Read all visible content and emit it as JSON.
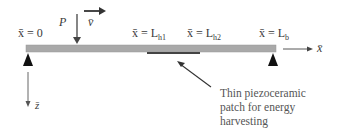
{
  "diagram": {
    "labels": {
      "x0": "x̄ = 0",
      "load": "P",
      "velocity": "v̄",
      "lh1": "x̄ = L",
      "lh1_sub": "h1",
      "lh2": "x̄ = L",
      "lh2_sub": "h2",
      "lb": "x̄ = L",
      "lb_sub": "b",
      "x_axis": "x̄",
      "z_axis": "z̄"
    },
    "annotation": {
      "line1": "Thin piezoceramic",
      "line2": "patch for energy",
      "line3": "harvesting"
    },
    "colors": {
      "beam": "#a9a9a9",
      "patch": "#444444",
      "support": "#111111",
      "arrow": "#333333"
    }
  }
}
